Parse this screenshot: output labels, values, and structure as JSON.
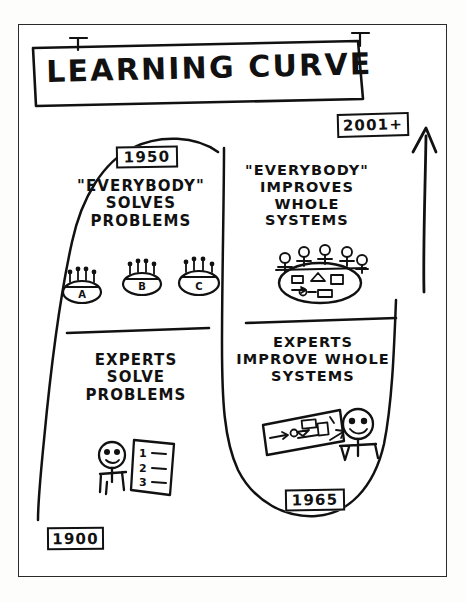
{
  "diagram": {
    "title": "LEARNING CURVE",
    "style": "hand-drawn whiteboard sketch, black ink on white",
    "frame_label": "outer-border"
  },
  "timeline": {
    "start_year": "1900",
    "mid_year_left": "1950",
    "mid_year_right": "1965",
    "end_year": "2001+",
    "direction_icon": "up-arrow"
  },
  "quadrants": {
    "top_left": {
      "heading": "\"EVERYBODY\"\nSOLVES\nPROBLEMS",
      "year": "1950",
      "icon": "three-small-groups-around-tables",
      "group_labels": [
        "A",
        "B",
        "C"
      ]
    },
    "bottom_left": {
      "heading": "EXPERTS\nSOLVE\nPROBLEMS",
      "year": "1900",
      "icon": "expert-with-numbered-checklist",
      "list_items": [
        "1",
        "2",
        "3"
      ]
    },
    "top_right": {
      "heading": "\"EVERYBODY\"\nIMPROVES\nWHOLE\nSYSTEMS",
      "year": "2001+",
      "icon": "team-around-table-with-process-flow"
    },
    "bottom_right": {
      "heading": "EXPERTS\nIMPROVE WHOLE\nSYSTEMS",
      "year": "1965",
      "icon": "expert-with-process-flowchart"
    }
  },
  "colors": {
    "ink": "#111111",
    "paper": "#ffffff",
    "page_background": "#fdfdfb"
  }
}
